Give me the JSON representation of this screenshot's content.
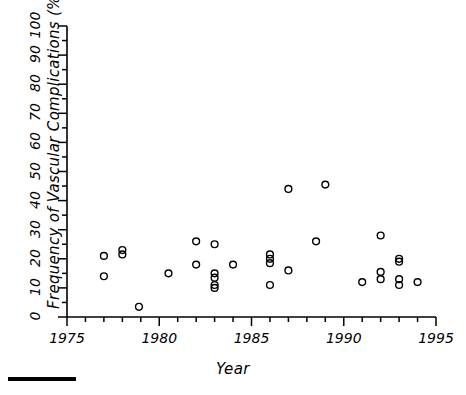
{
  "figure": {
    "ylabel": "Frequency of Vascular Complications (%)",
    "xlabel": "Year",
    "scalebar": "scale-rule"
  },
  "axes": {
    "x_tick_labels": [
      "1975",
      "1980",
      "1985",
      "1990",
      "1995"
    ],
    "y_tick_labels": [
      "0",
      "10",
      "20",
      "30",
      "40",
      "50",
      "60",
      "70",
      "80",
      "90",
      "100"
    ]
  },
  "colors": {
    "axis": "#000000",
    "marker": "#000000",
    "background": "#ffffff"
  },
  "chart_data": {
    "type": "scatter",
    "title": "",
    "xlabel": "Year",
    "ylabel": "Frequency of Vascular Complications (%)",
    "xlim": [
      1975,
      1995
    ],
    "ylim": [
      0,
      100
    ],
    "xticks": [
      1975,
      1980,
      1985,
      1990,
      1995
    ],
    "xminor_tick_interval": 1,
    "yticks": [
      0,
      10,
      20,
      30,
      40,
      50,
      60,
      70,
      80,
      90,
      100
    ],
    "yminor_tick_interval": 5,
    "grid": false,
    "legend": null,
    "marker": "open-circle",
    "points": [
      {
        "x": 1977.0,
        "y": 21.0
      },
      {
        "x": 1977.0,
        "y": 14.0
      },
      {
        "x": 1978.0,
        "y": 23.0
      },
      {
        "x": 1978.0,
        "y": 21.5
      },
      {
        "x": 1978.9,
        "y": 3.5
      },
      {
        "x": 1980.5,
        "y": 15.0
      },
      {
        "x": 1982.0,
        "y": 26.0
      },
      {
        "x": 1982.0,
        "y": 18.0
      },
      {
        "x": 1983.0,
        "y": 25.0
      },
      {
        "x": 1983.0,
        "y": 15.0
      },
      {
        "x": 1983.0,
        "y": 13.5
      },
      {
        "x": 1983.0,
        "y": 11.0
      },
      {
        "x": 1983.0,
        "y": 10.0
      },
      {
        "x": 1984.0,
        "y": 18.0
      },
      {
        "x": 1986.0,
        "y": 21.5
      },
      {
        "x": 1986.0,
        "y": 20.0
      },
      {
        "x": 1986.0,
        "y": 18.5
      },
      {
        "x": 1986.0,
        "y": 11.0
      },
      {
        "x": 1987.0,
        "y": 44.0
      },
      {
        "x": 1987.0,
        "y": 16.0
      },
      {
        "x": 1989.0,
        "y": 45.5
      },
      {
        "x": 1988.5,
        "y": 26.0
      },
      {
        "x": 1991.0,
        "y": 12.0
      },
      {
        "x": 1992.0,
        "y": 28.0
      },
      {
        "x": 1992.0,
        "y": 15.5
      },
      {
        "x": 1992.0,
        "y": 13.0
      },
      {
        "x": 1993.0,
        "y": 20.0
      },
      {
        "x": 1993.0,
        "y": 19.0
      },
      {
        "x": 1993.0,
        "y": 13.0
      },
      {
        "x": 1993.0,
        "y": 11.0
      },
      {
        "x": 1994.0,
        "y": 12.0
      }
    ]
  }
}
